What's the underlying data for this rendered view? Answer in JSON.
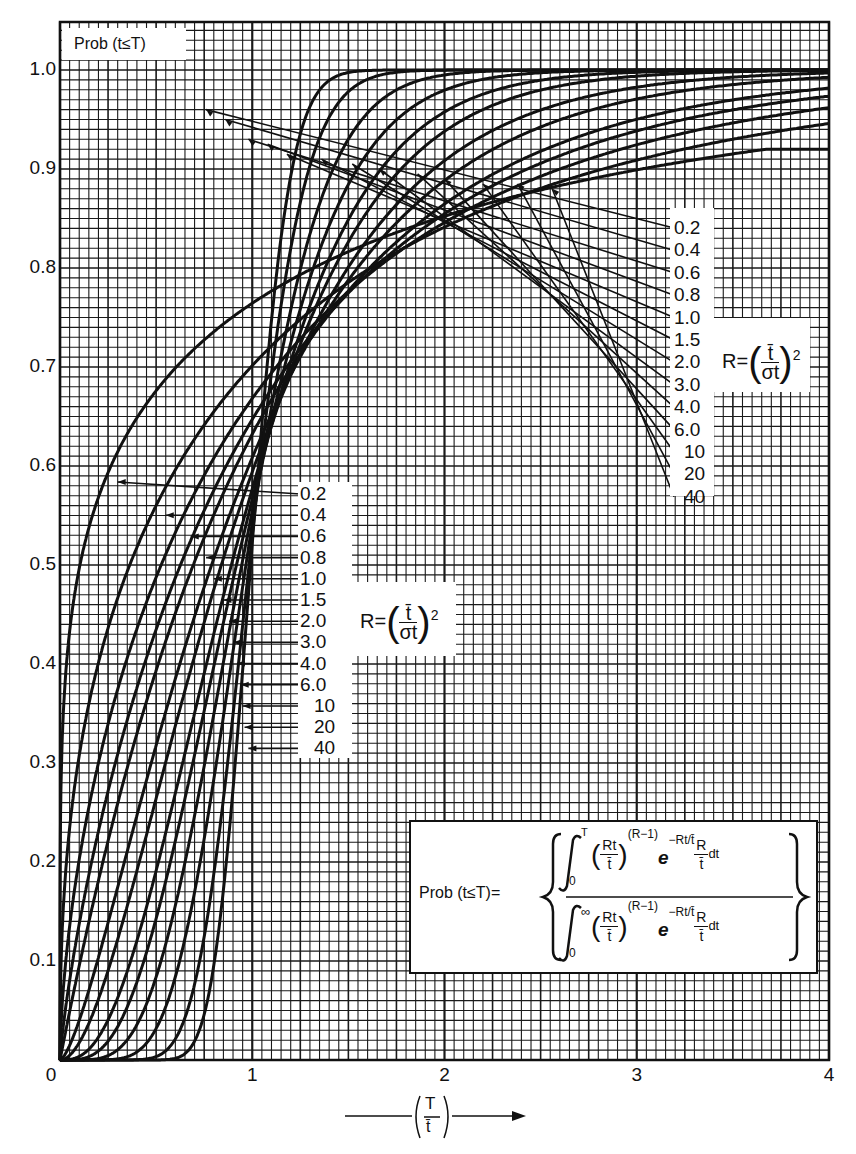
{
  "chart_data": {
    "type": "line",
    "title": "",
    "xlabel": "(T / t̄)",
    "ylabel": "Prob (t ≤ T)",
    "xlim": [
      0,
      4
    ],
    "ylim": [
      0,
      1.05
    ],
    "grid": true,
    "x_ticks": [
      "0",
      "1",
      "2",
      "3",
      "4"
    ],
    "y_ticks": [
      "0.1",
      "0.2",
      "0.3",
      "0.4",
      "0.5",
      "0.6",
      "0.7",
      "0.8",
      "0.9",
      "1.0"
    ],
    "legend_title": "R = (t̄ / σt)²",
    "parameter_name": "R",
    "x": [
      0,
      0.25,
      0.5,
      0.75,
      1.0,
      1.25,
      1.5,
      2.0,
      2.5,
      3.0,
      4.0
    ],
    "series": [
      {
        "name": "0.2",
        "R": 0.2,
        "values": [
          0,
          0.67,
          0.75,
          0.8,
          0.83,
          0.855,
          0.87,
          0.89,
          0.905,
          0.91,
          0.92
        ]
      },
      {
        "name": "0.4",
        "R": 0.4,
        "values": [
          0,
          0.46,
          0.6,
          0.69,
          0.75,
          0.8,
          0.83,
          0.88,
          0.915,
          0.935,
          0.96
        ]
      },
      {
        "name": "0.6",
        "R": 0.6,
        "values": [
          0,
          0.33,
          0.5,
          0.61,
          0.69,
          0.75,
          0.8,
          0.87,
          0.91,
          0.94,
          0.97
        ]
      },
      {
        "name": "0.8",
        "R": 0.8,
        "values": [
          0,
          0.25,
          0.42,
          0.55,
          0.64,
          0.72,
          0.78,
          0.86,
          0.91,
          0.95,
          0.98
        ]
      },
      {
        "name": "1.0",
        "R": 1.0,
        "values": [
          0,
          0.22,
          0.39,
          0.53,
          0.63,
          0.71,
          0.78,
          0.86,
          0.92,
          0.95,
          0.98
        ]
      },
      {
        "name": "1.5",
        "R": 1.5,
        "values": [
          0,
          0.14,
          0.32,
          0.48,
          0.61,
          0.71,
          0.78,
          0.88,
          0.94,
          0.97,
          0.99
        ]
      },
      {
        "name": "2.0",
        "R": 2.0,
        "values": [
          0,
          0.09,
          0.26,
          0.44,
          0.59,
          0.71,
          0.8,
          0.91,
          0.96,
          0.98,
          1.0
        ]
      },
      {
        "name": "3.0",
        "R": 3.0,
        "values": [
          0,
          0.04,
          0.19,
          0.39,
          0.58,
          0.72,
          0.83,
          0.94,
          0.98,
          0.99,
          1.0
        ]
      },
      {
        "name": "4.0",
        "R": 4.0,
        "values": [
          0,
          0.02,
          0.14,
          0.35,
          0.57,
          0.74,
          0.85,
          0.96,
          0.99,
          1.0,
          1.0
        ]
      },
      {
        "name": "6.0",
        "R": 6.0,
        "values": [
          0,
          0.004,
          0.08,
          0.3,
          0.55,
          0.76,
          0.88,
          0.98,
          1.0,
          1.0,
          1.0
        ]
      },
      {
        "name": "10",
        "R": 10,
        "values": [
          0,
          0.0,
          0.03,
          0.22,
          0.54,
          0.8,
          0.93,
          0.995,
          1.0,
          1.0,
          1.0
        ]
      },
      {
        "name": "20",
        "R": 20,
        "values": [
          0,
          0.0,
          0.005,
          0.13,
          0.53,
          0.86,
          0.98,
          1.0,
          1.0,
          1.0,
          1.0
        ]
      },
      {
        "name": "40",
        "R": 40,
        "values": [
          0,
          0.0,
          0.0,
          0.06,
          0.52,
          0.93,
          0.998,
          1.0,
          1.0,
          1.0,
          1.0
        ]
      }
    ],
    "annotations": [
      "Prob (t≤T) = ∫₀ᵀ (Rt/t̄)^(R−1) e^(−Rt/t̄) (R/t̄) dt / ∫₀^∞ (Rt/t̄)^(R−1) e^(−Rt/t̄) (R/t̄) dt"
    ]
  },
  "axis": {
    "y_ticks": [
      "1.0",
      "0.9",
      "0.8",
      "0.7",
      "0.6",
      "0.5",
      "0.4",
      "0.3",
      "0.2",
      "0.1",
      "0"
    ],
    "x_ticks": [
      "1",
      "2",
      "3",
      "4"
    ],
    "ylabel": "Prob (t≤T)",
    "xlabel_num": "T",
    "xlabel_den": "t̄"
  },
  "labels": {
    "r_values": [
      "0.2",
      "0.4",
      "0.6",
      "0.8",
      "1.0",
      "1.5",
      "2.0",
      "3.0",
      "4.0",
      "6.0",
      "10",
      "20",
      "40"
    ],
    "r_def_lhs": "R=",
    "r_def_num": "t̄",
    "r_def_den": "σt",
    "r_def_exp": "2"
  },
  "formula": {
    "lhs": "Prob (t≤T)=",
    "upper_limit_top": "T",
    "upper_limit_bottom": "∞",
    "lower_limit": "0",
    "base_num": "Rt",
    "base_den": "t̄",
    "exponent": "(R−1)",
    "e": "e",
    "e_exp": "−Rt/t̄",
    "factor_num": "R",
    "factor_den": "t̄",
    "dt": "dt"
  },
  "colors": {
    "ink": "#111111",
    "paper": "#ffffff",
    "grid": "#1a1a1a"
  }
}
